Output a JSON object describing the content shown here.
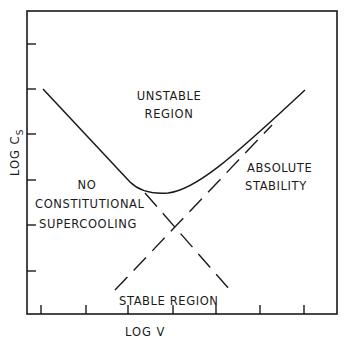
{
  "diagram": {
    "type": "phase-stability-diagram",
    "axes": {
      "x_label": "LOG V",
      "y_label_main": "LOG C",
      "y_label_sub": "S",
      "x_ticks": 7,
      "y_ticks": 6,
      "tick_labels": "none"
    },
    "regions": {
      "unstable_line1": "UNSTABLE",
      "unstable_line2": "REGION",
      "no_cs_line1": "NO",
      "no_cs_line2": "CONSTITUTIONAL",
      "no_cs_line3": "SUPERCOOLING",
      "absolute_line1": "ABSOLUTE",
      "absolute_line2": "STABILITY",
      "stable": "STABLE REGION"
    },
    "curves": [
      {
        "name": "stability-boundary",
        "style": "solid",
        "shape": "V-shaped curve with rounded minimum"
      },
      {
        "name": "constitutional-supercooling-limit",
        "style": "dashed",
        "slope": "negative"
      },
      {
        "name": "absolute-stability-limit",
        "style": "dashed",
        "slope": "positive"
      }
    ],
    "colors": {
      "ink": "#1a1a1a",
      "background": "#ffffff"
    }
  }
}
